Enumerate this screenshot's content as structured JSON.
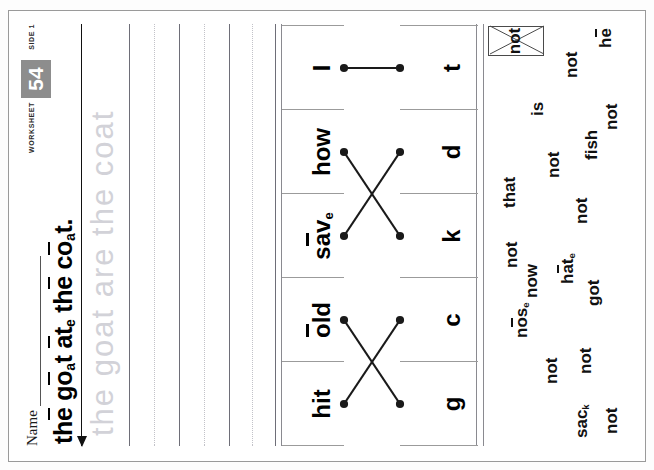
{
  "page": {
    "worksheet_caption": "WORKSHEET",
    "worksheet_number": "54",
    "side_caption": "SIDE 1",
    "name_label": "Name",
    "border_color": "#9a9a9a",
    "badge_color": "#8d8d8d"
  },
  "title": {
    "parts": [
      {
        "text": "th",
        "macron": false
      },
      {
        "text": "e",
        "macron": true
      },
      {
        "text": " g",
        "macron": false
      },
      {
        "text": "o",
        "macron": true
      },
      {
        "text": "a",
        "sub": true
      },
      {
        "text": "t ",
        "macron": false
      },
      {
        "text": "a",
        "macron": true
      },
      {
        "text": "t",
        "macron": false
      },
      {
        "text": "e",
        "sub": true
      },
      {
        "text": " th",
        "macron": false
      },
      {
        "text": "e",
        "macron": true
      },
      {
        "text": " c",
        "macron": false
      },
      {
        "text": "o",
        "macron": true
      },
      {
        "text": "a",
        "sub": true
      },
      {
        "text": "t.",
        "macron": false
      }
    ],
    "plain": "the goat ate the coat."
  },
  "writing_practice": {
    "traced_model_text": "the goat are the coat",
    "traced_color": "#d2d2d8",
    "rule_solid_color": "#6e6e78",
    "rule_dotted_color": "#c2c2c8",
    "line_count": 4
  },
  "matching": {
    "left_column_label": "letters",
    "right_column_label": "words",
    "letters": [
      "g",
      "c",
      "k",
      "d",
      "t"
    ],
    "words": [
      {
        "text": "hit",
        "macron_index": -1
      },
      {
        "text": "old",
        "macron_index": 0
      },
      {
        "text": "save",
        "macron_index": 1,
        "silent_e": true
      },
      {
        "text": "how",
        "macron_index": -1
      },
      {
        "text": "I",
        "macron_index": -1
      }
    ],
    "word_display": [
      "hit",
      "Ōld",
      "sāv",
      "how",
      "I"
    ],
    "connections": [
      {
        "from_letter_index": 0,
        "to_word_index": 1
      },
      {
        "from_letter_index": 1,
        "to_word_index": 0
      },
      {
        "from_letter_index": 2,
        "to_word_index": 3
      },
      {
        "from_letter_index": 3,
        "to_word_index": 2
      },
      {
        "from_letter_index": 4,
        "to_word_index": 4
      }
    ],
    "line_color": "#1a1a1a",
    "frame_color": "#8a8a90"
  },
  "word_bank": {
    "boxed_word": {
      "text": "not",
      "crossed_out": true
    },
    "words": [
      {
        "text": "not",
        "x": 12,
        "y": 118
      },
      {
        "text": "sac",
        "sub": "k",
        "x": 8,
        "y": 88
      },
      {
        "text": "not",
        "x": 72,
        "y": 92
      },
      {
        "text": "not",
        "x": 62,
        "y": 58
      },
      {
        "text": "nōs",
        "sub": "e",
        "macron": true,
        "x": 108,
        "y": 28
      },
      {
        "text": "now",
        "x": 148,
        "y": 38
      },
      {
        "text": "not",
        "x": 178,
        "y": 18
      },
      {
        "text": "got",
        "x": 140,
        "y": 100
      },
      {
        "text": "hāt",
        "sub": "e",
        "macron": true,
        "x": 162,
        "y": 74
      },
      {
        "text": "not",
        "x": 222,
        "y": 88
      },
      {
        "text": "that",
        "x": 238,
        "y": 16
      },
      {
        "text": "not",
        "x": 268,
        "y": 60
      },
      {
        "text": "fish",
        "x": 286,
        "y": 98
      },
      {
        "text": "not",
        "x": 316,
        "y": 118
      },
      {
        "text": "is",
        "x": 330,
        "y": 44
      },
      {
        "text": "not",
        "x": 368,
        "y": 78
      },
      {
        "text": "hē",
        "macron": true,
        "x": 398,
        "y": 112
      }
    ]
  }
}
